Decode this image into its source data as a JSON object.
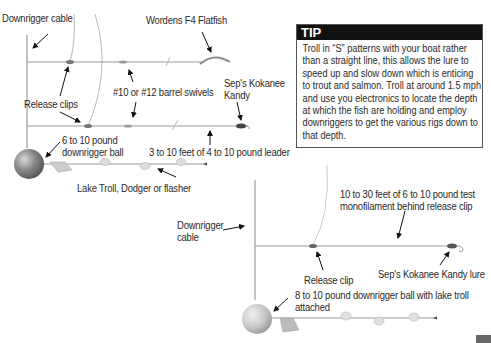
{
  "top_rig": {
    "labels": {
      "downrigger_cable": "Downrigger cable",
      "lure_top": "Wordens F4 Flatfish",
      "swivels": "#10 or #12 barrel swivels",
      "lure_bottom_line1": "Sep's Kokanee",
      "lure_bottom_line2": "Kandy",
      "release_clips": "Release clips",
      "ball_line1": "6 to 10 pound",
      "ball_line2": "downrigger ball",
      "leader": "3 to 10 feet of 4 to 10 pound leader",
      "troll": "Lake Troll, Dodger or flasher"
    }
  },
  "bottom_rig": {
    "labels": {
      "cable_line1": "Downrigger",
      "cable_line2": "cable",
      "mono_line1": "10 to 30 feet of 6 to 10 pound test",
      "mono_line2": "monofilament behind release clip",
      "release_clip": "Release clip",
      "lure": "Sep's Kokanee Kandy lure",
      "ball_line1": "8 to 10 pound downrigger ball with lake troll",
      "ball_line2": "attached"
    }
  },
  "tip": {
    "title": "TIP",
    "body": "Troll in “S” patterns with your boat rather than a straight line, this allows the lure to speed up and slow down which is enticing to trout and salmon. Troll at around 1.5 mph and use you electronics to locate the depth at which the fish are holding and employ downriggers to get the various rigs down to that depth."
  },
  "colors": {
    "line": "#8a8a8a",
    "arrow": "#111111",
    "tip_header": "#111111",
    "ball": "#7d7d7d"
  }
}
